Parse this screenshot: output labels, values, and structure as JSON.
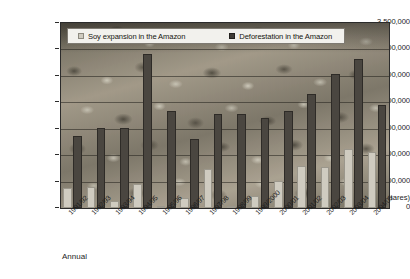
{
  "chart_data": {
    "type": "bar",
    "title": "",
    "xlabel": "Annual",
    "ylabel": "(hectares)",
    "ylim": [
      0,
      3500000
    ],
    "ytick_values": [
      3500000,
      3000000,
      2500000,
      2000000,
      1500000,
      1000000,
      500000,
      0
    ],
    "ytick_labels": [
      "3,500,000",
      "3,000,000",
      "2,500,000",
      "2,000,000",
      "1,500,000",
      "1,000,000",
      "500,000",
      "0"
    ],
    "grid": true,
    "legend_position": "top-inside",
    "categories": [
      "1991/92",
      "1992/93",
      "1993/94",
      "1994/95",
      "1995/96",
      "1996/97",
      "1997/98",
      "1998/99",
      "1999/2000",
      "2000/01",
      "2001/02",
      "2002/03",
      "2003/04",
      "2004/05"
    ],
    "series": [
      {
        "name": "Soy expansion in the Amazon",
        "color": "#cfcbc0",
        "values": [
          380000,
          400000,
          130000,
          450000,
          20000,
          190000,
          730000,
          30000,
          220000,
          520000,
          800000,
          770000,
          1110000,
          1060000
        ]
      },
      {
        "name": "Deforestation in the Amazon",
        "color": "#4a4640",
        "values": [
          1370000,
          1510000,
          1510000,
          2910000,
          1840000,
          1300000,
          1780000,
          1770000,
          1710000,
          1840000,
          2160000,
          2540000,
          2820000,
          1950000
        ]
      }
    ]
  },
  "legend": {
    "items": [
      {
        "label": "Soy expansion in the Amazon",
        "swatch": "soy-swatch"
      },
      {
        "label": "Deforestation in the Amazon",
        "swatch": "deforestation-swatch"
      }
    ]
  },
  "axes": {
    "x_title": "Annual",
    "y_units": "(hectares)"
  }
}
